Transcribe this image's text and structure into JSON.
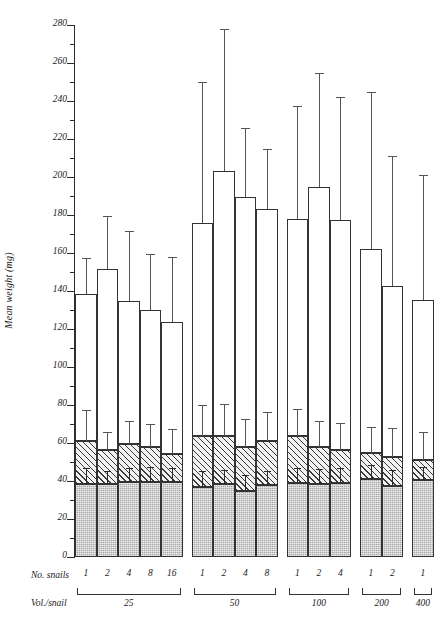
{
  "chart_data": {
    "type": "bar",
    "title": "",
    "xlabel": "",
    "ylabel": "Mean weight (mg)",
    "ylim": [
      0,
      280
    ],
    "ytick_step": 20,
    "yminor_step": 10,
    "grid": false,
    "legend": false,
    "stacked": true,
    "row_labels": {
      "snails": "No. snails",
      "volume": "Vol./snail"
    },
    "ytick_labels": [
      "0",
      "20",
      "40",
      "60",
      "80",
      "100",
      "120",
      "140",
      "160",
      "180",
      "200",
      "220",
      "240",
      "260",
      "280"
    ],
    "groups": [
      {
        "volume": "25",
        "bars": [
          {
            "snails": "1",
            "total": 138.5,
            "total_err_top": 157.0,
            "mid": 61.0,
            "mid_err_top": 77.0,
            "low": 38.5,
            "low_err_top": 46.5
          },
          {
            "snails": "2",
            "total": 151.5,
            "total_err_top": 179.0,
            "mid": 56.5,
            "mid_err_top": 65.5,
            "low": 38.5,
            "low_err_top": 45.0
          },
          {
            "snails": "4",
            "total": 135.0,
            "total_err_top": 171.0,
            "mid": 59.5,
            "mid_err_top": 71.0,
            "low": 39.5,
            "low_err_top": 46.5
          },
          {
            "snails": "8",
            "total": 130.0,
            "total_err_top": 159.0,
            "mid": 58.0,
            "mid_err_top": 69.5,
            "low": 39.5,
            "low_err_top": 47.0
          },
          {
            "snails": "16",
            "total": 123.5,
            "total_err_top": 157.5,
            "mid": 54.0,
            "mid_err_top": 67.0,
            "low": 39.5,
            "low_err_top": 46.5
          }
        ]
      },
      {
        "volume": "50",
        "bars": [
          {
            "snails": "1",
            "total": 176.0,
            "total_err_top": 249.5,
            "mid": 63.5,
            "mid_err_top": 79.5,
            "low": 37.0,
            "low_err_top": 45.0
          },
          {
            "snails": "2",
            "total": 203.0,
            "total_err_top": 277.5,
            "mid": 63.5,
            "mid_err_top": 80.0,
            "low": 38.5,
            "low_err_top": 45.5
          },
          {
            "snails": "4",
            "total": 189.5,
            "total_err_top": 225.5,
            "mid": 58.0,
            "mid_err_top": 72.0,
            "low": 34.5,
            "low_err_top": 42.5
          },
          {
            "snails": "8",
            "total": 183.0,
            "total_err_top": 214.0,
            "mid": 61.0,
            "mid_err_top": 76.0,
            "low": 38.0,
            "low_err_top": 45.0
          }
        ]
      },
      {
        "volume": "100",
        "bars": [
          {
            "snails": "1",
            "total": 178.0,
            "total_err_top": 237.0,
            "mid": 63.5,
            "mid_err_top": 77.5,
            "low": 39.0,
            "low_err_top": 46.5
          },
          {
            "snails": "2",
            "total": 194.5,
            "total_err_top": 254.0,
            "mid": 58.0,
            "mid_err_top": 71.0,
            "low": 38.5,
            "low_err_top": 46.0
          },
          {
            "snails": "4",
            "total": 177.5,
            "total_err_top": 241.5,
            "mid": 56.5,
            "mid_err_top": 70.0,
            "low": 39.0,
            "low_err_top": 46.5
          }
        ]
      },
      {
        "volume": "200",
        "bars": [
          {
            "snails": "1",
            "total": 162.0,
            "total_err_top": 244.0,
            "mid": 55.0,
            "mid_err_top": 68.0,
            "low": 41.0,
            "low_err_top": 48.0
          },
          {
            "snails": "2",
            "total": 142.5,
            "total_err_top": 210.5,
            "mid": 52.5,
            "mid_err_top": 67.5,
            "low": 37.5,
            "low_err_top": 45.5
          }
        ]
      },
      {
        "volume": "400",
        "bars": [
          {
            "snails": "1",
            "total": 135.5,
            "total_err_top": 200.5,
            "mid": 51.0,
            "mid_err_top": 65.5,
            "low": 40.5,
            "low_err_top": 47.0
          }
        ]
      }
    ]
  }
}
